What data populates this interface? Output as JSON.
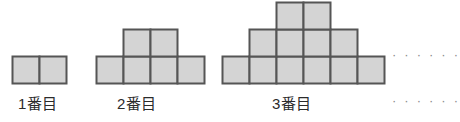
{
  "diagram": {
    "colors": {
      "cell_fill": "#d4d4d4",
      "cell_stroke": "#555555",
      "label_text": "#2b2b2b",
      "dots": "#8a8a8a",
      "background": "#ffffff"
    },
    "cell_size": 27,
    "stroke_width": 2,
    "figures": [
      {
        "id": "figure-1",
        "label": "1番目",
        "label_x": 18,
        "label_y": 92,
        "origin_x": 12,
        "baseline_y": 83,
        "rows": [
          {
            "level": 1,
            "count": 2,
            "offset_cells": 0
          }
        ],
        "total_squares": 2
      },
      {
        "id": "figure-2",
        "label": "2番目",
        "label_x": 117,
        "label_y": 92,
        "origin_x": 96,
        "baseline_y": 83,
        "rows": [
          {
            "level": 1,
            "count": 4,
            "offset_cells": 0
          },
          {
            "level": 2,
            "count": 2,
            "offset_cells": 1
          }
        ],
        "total_squares": 6
      },
      {
        "id": "figure-3",
        "label": "3番目",
        "label_x": 272,
        "label_y": 92,
        "origin_x": 222,
        "baseline_y": 83,
        "rows": [
          {
            "level": 1,
            "count": 6,
            "offset_cells": 0
          },
          {
            "level": 2,
            "count": 4,
            "offset_cells": 1
          },
          {
            "level": 3,
            "count": 2,
            "offset_cells": 2
          }
        ],
        "total_squares": 12
      }
    ],
    "ellipses": [
      {
        "id": "ellipsis-figures",
        "text": "……",
        "dots": "· · · · · ·",
        "x": 392,
        "y": 47
      },
      {
        "id": "ellipsis-labels",
        "text": "……",
        "dots": "· · · · · ·",
        "x": 392,
        "y": 93
      }
    ]
  }
}
